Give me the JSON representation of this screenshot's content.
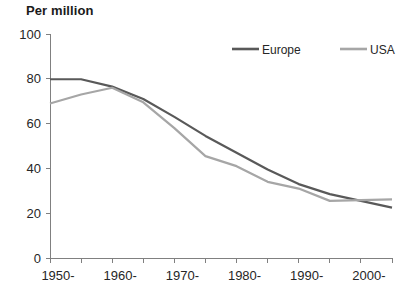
{
  "chart_data": {
    "type": "line",
    "title": "Per million",
    "xlabel": "",
    "ylabel": "",
    "ylim": [
      0,
      100
    ],
    "xlim": [
      1950,
      2005
    ],
    "grid": false,
    "legend_position": "top-right",
    "y_ticks": [
      "0",
      "20",
      "40",
      "60",
      "80",
      "100"
    ],
    "y_tick_values": [
      0,
      20,
      40,
      60,
      80,
      100
    ],
    "x_tick_labels": [
      "1950-",
      "1960-",
      "1970-",
      "1980-",
      "1990-",
      "2000-"
    ],
    "x_tick_label_values": [
      1950,
      1960,
      1970,
      1980,
      1990,
      2000
    ],
    "x_minor_ticks": [
      1950,
      1955,
      1960,
      1965,
      1970,
      1975,
      1980,
      1985,
      1990,
      1995,
      2000,
      2005
    ],
    "x": [
      1950,
      1955,
      1960,
      1965,
      1970,
      1975,
      1980,
      1985,
      1990,
      1995,
      2000,
      2005
    ],
    "series": [
      {
        "name": "Europe",
        "color": "#595959",
        "values": [
          79.8,
          79.8,
          76.5,
          71.0,
          63.0,
          54.5,
          47.0,
          39.5,
          33.0,
          28.5,
          25.5,
          22.5
        ]
      },
      {
        "name": "USA",
        "color": "#a6a6a6",
        "values": [
          69.0,
          73.0,
          76.0,
          69.5,
          58.0,
          45.5,
          41.0,
          34.0,
          31.0,
          25.5,
          25.8,
          26.2
        ]
      }
    ]
  },
  "legend": {
    "items": [
      {
        "label": "Europe",
        "color": "#595959"
      },
      {
        "label": "USA",
        "color": "#a6a6a6"
      }
    ]
  },
  "axis_colors": {
    "axis": "#808080",
    "text": "#262626"
  }
}
